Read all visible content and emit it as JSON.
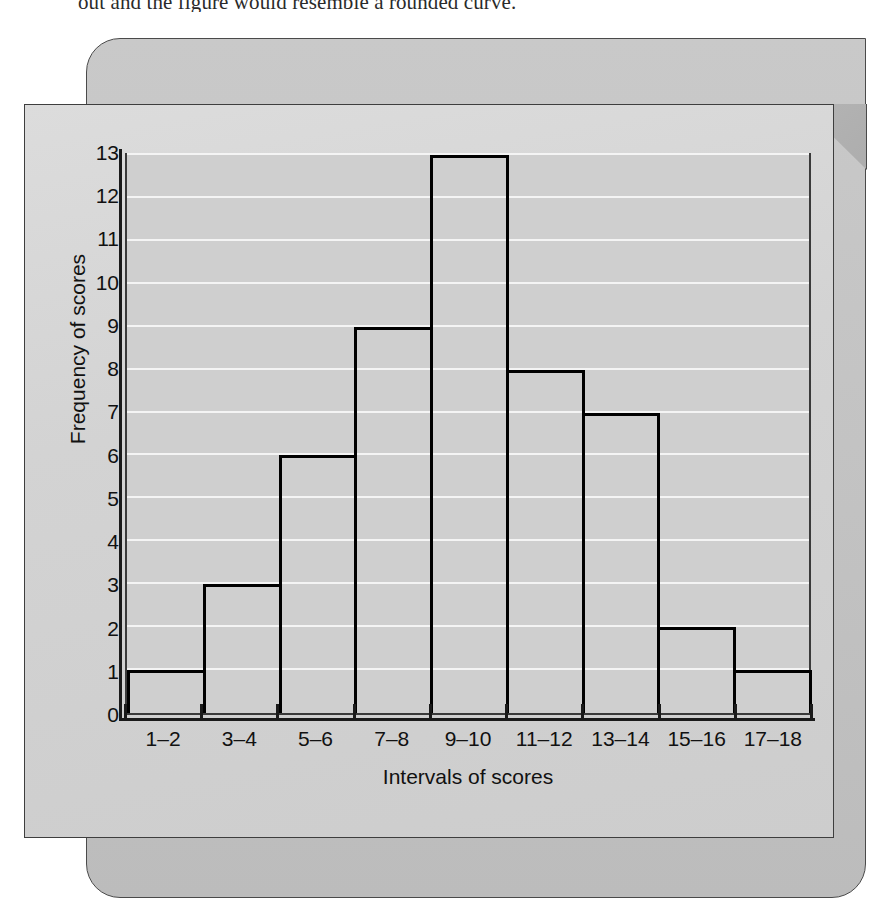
{
  "body_text": {
    "cropped_line": "out and the figure would resemble a rounded curve."
  },
  "chart_data": {
    "type": "bar",
    "title": "",
    "subtitle": "",
    "xlabel": "Intervals of scores",
    "ylabel": "Frequency of scores",
    "categories": [
      "1–2",
      "3–4",
      "5–6",
      "7–8",
      "9–10",
      "11–12",
      "13–14",
      "15–16",
      "17–18"
    ],
    "values": [
      1,
      3,
      6,
      9,
      13,
      8,
      7,
      2,
      1
    ],
    "ylim": [
      0,
      13
    ],
    "yticks": [
      0,
      1,
      2,
      3,
      4,
      5,
      6,
      7,
      8,
      9,
      10,
      11,
      12,
      13
    ],
    "grid": true,
    "grid_orientation": "horizontal",
    "legend": null,
    "bar_gap": 0,
    "annotations": []
  },
  "style": {
    "plot_background": "#cfcfcf",
    "gridline_color": "#f4f4f4",
    "bar_outline_color": "#000000",
    "axis_color": "#1a1a1a",
    "panel_front": "#d5d5d5",
    "panel_back": "#c4c4c4",
    "text_color": "#111111"
  }
}
